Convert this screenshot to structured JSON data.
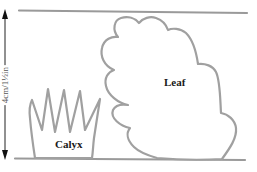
{
  "labels": {
    "leaf": "Leaf",
    "calyx": "Calyx"
  },
  "measurement": {
    "text": "4cm/1½in",
    "direction": "vertical",
    "arrow_top_icon": "arrow-up-icon",
    "arrow_bottom_icon": "arrow-down-icon"
  },
  "colors": {
    "outline": "#a0a0a0",
    "guide_lines": "#9a9a9a",
    "text": "#1a1a1a",
    "background": "#ffffff"
  }
}
